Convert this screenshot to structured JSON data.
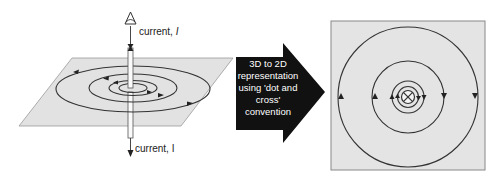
{
  "diagram": {
    "left_panel": {
      "top_label": "current, ",
      "top_label_italic": "I",
      "bottom_label": "current, I",
      "description": "3D view of current-carrying wire through plane with concentric magnetic field loops"
    },
    "arrow": {
      "lines": [
        "3D to 2D",
        "representation",
        "using 'dot and",
        "cross'",
        "convention"
      ]
    },
    "right_panel": {
      "description": "2D top view with concentric field circles and cross symbol (current into page)",
      "center_symbol": "cross-in-circle"
    },
    "colors": {
      "plane_fill": "#e2e2e2",
      "line": "#333333",
      "arrow_fill": "#111111",
      "panel_border": "#888888"
    }
  }
}
